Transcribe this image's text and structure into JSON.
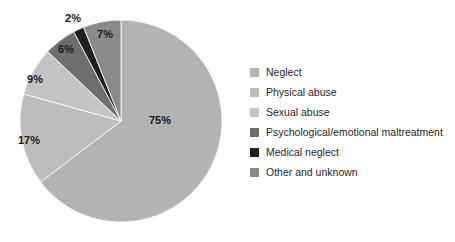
{
  "chart_data": {
    "type": "pie",
    "title": "",
    "subtitle": "",
    "xlabel": "",
    "ylabel": "",
    "grid": false,
    "legend_position": "right",
    "start_angle_deg": 0,
    "direction": "clockwise",
    "categories": [
      "Neglect",
      "Physical abuse",
      "Sexual abuse",
      "Psychological/emotional maltreatment",
      "Medical neglect",
      "Other and unknown"
    ],
    "values": [
      75,
      17,
      9,
      6,
      2,
      7
    ],
    "data_labels": [
      "75%",
      "17%",
      "9%",
      "6%",
      "2%",
      "7%"
    ],
    "colors": [
      "#b3b3b3",
      "#bdbdbd",
      "#c4c4c4",
      "#6e6e6e",
      "#1f1f1f",
      "#8a8a8a"
    ],
    "slices": [
      {
        "label": "Neglect",
        "value": 75,
        "data_label": "75%",
        "color": "#b3b3b3",
        "label_x": 160,
        "label_y": 121
      },
      {
        "label": "Physical abuse",
        "value": 17,
        "data_label": "17%",
        "color": "#bdbdbd",
        "label_x": 29,
        "label_y": 141
      },
      {
        "label": "Sexual abuse",
        "value": 9,
        "data_label": "9%",
        "color": "#c4c4c4",
        "label_x": 35,
        "label_y": 80
      },
      {
        "label": "Psychological/emotional maltreatment",
        "value": 6,
        "data_label": "6%",
        "color": "#6e6e6e",
        "label_x": 66,
        "label_y": 50
      },
      {
        "label": "Medical neglect",
        "value": 2,
        "data_label": "2%",
        "color": "#1f1f1f",
        "label_x": 73,
        "label_y": 19
      },
      {
        "label": "Other and unknown",
        "value": 7,
        "data_label": "7%",
        "color": "#8a8a8a",
        "label_x": 105,
        "label_y": 35
      }
    ]
  },
  "legend": {
    "items": [
      {
        "label": "Neglect",
        "color": "#b3b3b3"
      },
      {
        "label": "Physical abuse",
        "color": "#bdbdbd"
      },
      {
        "label": "Sexual abuse",
        "color": "#c4c4c4"
      },
      {
        "label": "Psychological/emotional maltreatment",
        "color": "#6e6e6e"
      },
      {
        "label": "Medical neglect",
        "color": "#1f1f1f"
      },
      {
        "label": "Other and unknown",
        "color": "#8a8a8a"
      }
    ]
  },
  "geometry": {
    "center_x": 121,
    "center_y": 121,
    "radius": 101
  }
}
